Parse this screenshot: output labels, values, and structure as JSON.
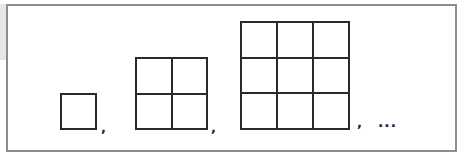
{
  "figure": {
    "sequence": [
      {
        "n": 1,
        "rows": 1,
        "cols": 1,
        "separator": ","
      },
      {
        "n": 2,
        "rows": 2,
        "cols": 2,
        "separator": ","
      },
      {
        "n": 3,
        "rows": 3,
        "cols": 3,
        "separator": ","
      }
    ],
    "continuation": "...",
    "colors": {
      "line": "#2a2a2a",
      "frame": "#8c8c8c",
      "background": "#ffffff"
    }
  }
}
